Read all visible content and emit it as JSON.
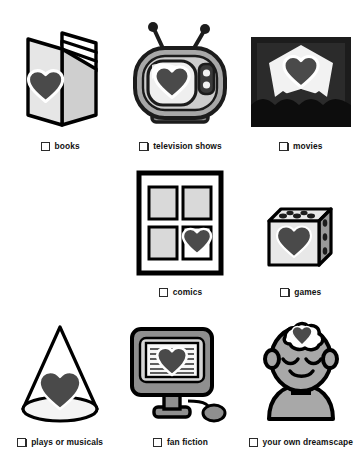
{
  "page": {
    "background_color": "#ffffff",
    "cut_off_header_text": "",
    "columns": 3,
    "rows": 3
  },
  "palette": {
    "ink": "#1a1a1a",
    "outline": "#000000",
    "heart": "#4a4a4a",
    "heart_halo": "#ffffff",
    "light_gray": "#d9d9d9",
    "mid_gray": "#a8a8a8",
    "dark_gray": "#6f6f6f",
    "near_black": "#1c1c1c",
    "checkbox_fill": "#ffffff",
    "checkbox_border": "#2b2b2b"
  },
  "items": [
    {
      "id": "books",
      "label": "books",
      "icon": "open-book-icon",
      "checked": false,
      "row": 1,
      "column": 1
    },
    {
      "id": "television-shows",
      "label": "television shows",
      "icon": "retro-television-icon",
      "checked": false,
      "row": 1,
      "column": 2
    },
    {
      "id": "movies",
      "label": "movies",
      "icon": "movie-theater-screen-icon",
      "checked": false,
      "row": 1,
      "column": 3
    },
    {
      "id": "comics",
      "label": "comics",
      "icon": "comic-page-panels-icon",
      "checked": false,
      "row": 2,
      "column": 1
    },
    {
      "id": "games",
      "label": "games",
      "icon": "dice-cube-icon",
      "checked": false,
      "row": 2,
      "column": 2
    },
    {
      "id": "plays-or-musicals",
      "label": "plays or musicals",
      "icon": "stage-spotlight-cone-icon",
      "checked": false,
      "row": 3,
      "column": 1
    },
    {
      "id": "fan-fiction",
      "label": "fan fiction",
      "icon": "computer-monitor-icon",
      "checked": false,
      "row": 3,
      "column": 2
    },
    {
      "id": "your-own-dreamscape",
      "label": "your own dreamscape",
      "icon": "head-with-thought-cloud-icon",
      "checked": false,
      "row": 3,
      "column": 3
    }
  ]
}
